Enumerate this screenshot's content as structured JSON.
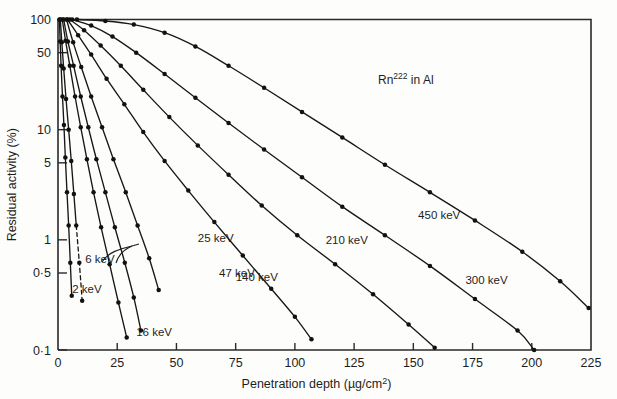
{
  "figure": {
    "annotation": {
      "species": "Rn",
      "mass_number": "222",
      "medium": " in Al"
    }
  },
  "chart_data": {
    "type": "line",
    "title": "Rn222 in Al",
    "xlabel": "Penetration depth (µg/cm²)",
    "ylabel": "Residual activity (%)",
    "xlabel_parts": {
      "main": "Penetration depth (",
      "unit": "µg/cm",
      "exponent": "2",
      "close": ")"
    },
    "xscale": "linear",
    "yscale": "log",
    "xlim": [
      0,
      225
    ],
    "ylim": [
      0.1,
      100
    ],
    "grid": false,
    "legend": "inline-labels",
    "xticks": [
      0,
      25,
      50,
      75,
      100,
      125,
      150,
      175,
      200,
      225
    ],
    "xtick_labels": [
      "0",
      "25",
      "50",
      "75",
      "100",
      "125",
      "150",
      "175",
      "200",
      "225"
    ],
    "yticks": [
      100,
      50,
      10,
      5,
      1,
      0.5,
      0.1
    ],
    "ytick_labels": [
      "100",
      "50",
      "10",
      "5",
      "1",
      "0·5",
      "0·1"
    ],
    "series": [
      {
        "name": "2 keV",
        "label": "2 keV",
        "label_x": 6,
        "label_y": 0.33,
        "dashed": false,
        "points": [
          {
            "x": 0.6,
            "y": 100
          },
          {
            "x": 0.9,
            "y": 63
          },
          {
            "x": 1.3,
            "y": 38
          },
          {
            "x": 1.9,
            "y": 20
          },
          {
            "x": 2.5,
            "y": 11
          },
          {
            "x": 3.1,
            "y": 5.6
          },
          {
            "x": 3.8,
            "y": 2.7
          },
          {
            "x": 4.5,
            "y": 1.35
          },
          {
            "x": 5.2,
            "y": 0.62
          },
          {
            "x": 5.8,
            "y": 0.31
          }
        ]
      },
      {
        "name": "6 keV",
        "label": "6 keV",
        "label_x": 11.5,
        "label_y": 0.62,
        "dashed": true,
        "dash_from_index": 7,
        "points": [
          {
            "x": 1.0,
            "y": 100
          },
          {
            "x": 1.6,
            "y": 62
          },
          {
            "x": 2.4,
            "y": 36
          },
          {
            "x": 3.4,
            "y": 19
          },
          {
            "x": 4.5,
            "y": 10
          },
          {
            "x": 5.6,
            "y": 5.2
          },
          {
            "x": 6.7,
            "y": 2.6
          },
          {
            "x": 7.7,
            "y": 1.35
          },
          {
            "x": 9.0,
            "y": 0.62
          },
          {
            "x": 10.2,
            "y": 0.28
          }
        ]
      },
      {
        "name": "16 keV",
        "label": "16 keV",
        "label_x": 33,
        "label_y": 0.135,
        "dashed": false,
        "points": [
          {
            "x": 1.8,
            "y": 100
          },
          {
            "x": 3.2,
            "y": 64
          },
          {
            "x": 5.0,
            "y": 38
          },
          {
            "x": 7.2,
            "y": 20
          },
          {
            "x": 9.6,
            "y": 10.5
          },
          {
            "x": 12.2,
            "y": 5.4
          },
          {
            "x": 15.0,
            "y": 2.7
          },
          {
            "x": 18.2,
            "y": 1.3
          },
          {
            "x": 21.8,
            "y": 0.6
          },
          {
            "x": 25.5,
            "y": 0.27
          },
          {
            "x": 29.0,
            "y": 0.13
          }
        ]
      },
      {
        "name": "25 keV",
        "label": "25 keV",
        "label_x": 59,
        "label_y": 0.95,
        "dashed": false,
        "points": [
          {
            "x": 2.4,
            "y": 100
          },
          {
            "x": 4.2,
            "y": 63
          },
          {
            "x": 6.6,
            "y": 38
          },
          {
            "x": 9.6,
            "y": 20
          },
          {
            "x": 12.8,
            "y": 10.5
          },
          {
            "x": 16.2,
            "y": 5.4
          },
          {
            "x": 20.0,
            "y": 2.7
          },
          {
            "x": 24.0,
            "y": 1.3
          },
          {
            "x": 28.2,
            "y": 0.62
          },
          {
            "x": 32.0,
            "y": 0.3
          },
          {
            "x": 35.0,
            "y": 0.15
          }
        ]
      },
      {
        "name": "47 keV",
        "label": "47 keV",
        "label_x": 68,
        "label_y": 0.46,
        "dashed": false,
        "points": [
          {
            "x": 3.6,
            "y": 100
          },
          {
            "x": 6.4,
            "y": 62
          },
          {
            "x": 9.8,
            "y": 37
          },
          {
            "x": 14.0,
            "y": 20
          },
          {
            "x": 18.6,
            "y": 10.5
          },
          {
            "x": 23.4,
            "y": 5.4
          },
          {
            "x": 28.6,
            "y": 2.7
          },
          {
            "x": 33.6,
            "y": 1.35
          },
          {
            "x": 38.5,
            "y": 0.68
          },
          {
            "x": 42.5,
            "y": 0.35
          }
        ]
      },
      {
        "name": "140 keV",
        "label": "140 keV",
        "label_x": 75,
        "label_y": 0.42,
        "dashed": false,
        "points": [
          {
            "x": 4.0,
            "y": 100
          },
          {
            "x": 8.5,
            "y": 72
          },
          {
            "x": 14.0,
            "y": 48
          },
          {
            "x": 20.5,
            "y": 29
          },
          {
            "x": 28.0,
            "y": 17
          },
          {
            "x": 36.0,
            "y": 9.5
          },
          {
            "x": 45.0,
            "y": 5.2
          },
          {
            "x": 55.0,
            "y": 2.8
          },
          {
            "x": 66.0,
            "y": 1.45
          },
          {
            "x": 78.0,
            "y": 0.72
          },
          {
            "x": 90.0,
            "y": 0.36
          },
          {
            "x": 100.0,
            "y": 0.2
          },
          {
            "x": 107.0,
            "y": 0.125
          }
        ]
      },
      {
        "name": "210 keV",
        "label": "210 keV",
        "label_x": 113,
        "label_y": 0.92,
        "dashed": false,
        "points": [
          {
            "x": 5.0,
            "y": 100
          },
          {
            "x": 11.0,
            "y": 80
          },
          {
            "x": 18.0,
            "y": 58
          },
          {
            "x": 26.5,
            "y": 38
          },
          {
            "x": 36.0,
            "y": 23
          },
          {
            "x": 47.0,
            "y": 13
          },
          {
            "x": 59.0,
            "y": 7.2
          },
          {
            "x": 72.0,
            "y": 3.9
          },
          {
            "x": 86.0,
            "y": 2.05
          },
          {
            "x": 101.0,
            "y": 1.1
          },
          {
            "x": 117.0,
            "y": 0.6
          },
          {
            "x": 133.0,
            "y": 0.32
          },
          {
            "x": 148.0,
            "y": 0.17
          },
          {
            "x": 159.0,
            "y": 0.105
          }
        ]
      },
      {
        "name": "300 keV",
        "label": "300 keV",
        "label_x": 172,
        "label_y": 0.4,
        "dashed": false,
        "points": [
          {
            "x": 6.0,
            "y": 100
          },
          {
            "x": 14.0,
            "y": 88
          },
          {
            "x": 23.0,
            "y": 70
          },
          {
            "x": 33.0,
            "y": 50
          },
          {
            "x": 45.0,
            "y": 32
          },
          {
            "x": 58.0,
            "y": 19.5
          },
          {
            "x": 72.0,
            "y": 11.5
          },
          {
            "x": 87.0,
            "y": 6.6
          },
          {
            "x": 103.0,
            "y": 3.7
          },
          {
            "x": 120.0,
            "y": 2.0
          },
          {
            "x": 138.0,
            "y": 1.1
          },
          {
            "x": 157.0,
            "y": 0.58
          },
          {
            "x": 176.0,
            "y": 0.29
          },
          {
            "x": 194.0,
            "y": 0.15
          },
          {
            "x": 201.0,
            "y": 0.1
          }
        ]
      },
      {
        "name": "450 keV",
        "label": "450 keV",
        "label_x": 152,
        "label_y": 1.55,
        "dashed": false,
        "points": [
          {
            "x": 8.0,
            "y": 100
          },
          {
            "x": 20.0,
            "y": 97
          },
          {
            "x": 32.0,
            "y": 90
          },
          {
            "x": 45.0,
            "y": 76
          },
          {
            "x": 58.0,
            "y": 57
          },
          {
            "x": 72.0,
            "y": 38
          },
          {
            "x": 87.0,
            "y": 24
          },
          {
            "x": 103.0,
            "y": 14.5
          },
          {
            "x": 120.0,
            "y": 8.5
          },
          {
            "x": 138.0,
            "y": 4.8
          },
          {
            "x": 157.0,
            "y": 2.7
          },
          {
            "x": 176.0,
            "y": 1.5
          },
          {
            "x": 196.0,
            "y": 0.78
          },
          {
            "x": 212.0,
            "y": 0.42
          },
          {
            "x": 224.0,
            "y": 0.24
          }
        ]
      }
    ]
  }
}
